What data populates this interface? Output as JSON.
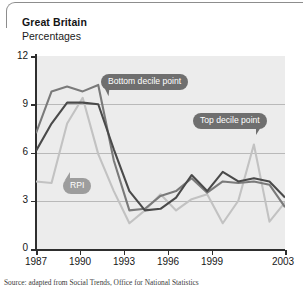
{
  "header": {
    "region": "Great Britain",
    "units": "Percentages"
  },
  "source_note": "Source: adapted from Social Trends, Office for National Statistics",
  "callouts": {
    "bottom": "Bottom decile point",
    "top": "Top decile point",
    "rpi": "RPI"
  },
  "colors": {
    "top_decile": "#4a4a4a",
    "bottom_decile": "#7a7a7a",
    "rpi": "#c2c2c2",
    "plot_background": "#ececec",
    "gridline": "#b9b9b9",
    "axis": "#2e2e2e",
    "callout_dark": "#6f6f6f",
    "callout_light": "#9d9d9d"
  },
  "chart_data": {
    "type": "line",
    "title": "Great Britain",
    "subtitle": "Percentages",
    "xlabel": "",
    "ylabel": "Percentages",
    "xlim": [
      1987,
      2003
    ],
    "ylim": [
      0,
      12
    ],
    "yticks": [
      0,
      3,
      6,
      9,
      12
    ],
    "xticks": [
      1987,
      1990,
      1993,
      1996,
      1999,
      2003
    ],
    "xtick_labels": [
      "1987",
      "1990",
      "1993",
      "1996",
      "1999",
      "2003"
    ],
    "ytick_labels": [
      "0",
      "3",
      "6",
      "9",
      "12"
    ],
    "grid": true,
    "legend": "inline-callouts",
    "x": [
      1987,
      1988,
      1989,
      1990,
      1991,
      1992,
      1993,
      1994,
      1995,
      1996,
      1997,
      1998,
      1999,
      2000,
      2001,
      2002,
      2003
    ],
    "series": [
      {
        "name": "Bottom decile point",
        "color": "#7a7a7a",
        "values": [
          7.2,
          9.8,
          10.1,
          9.8,
          10.2,
          5.5,
          2.4,
          2.5,
          3.3,
          3.6,
          4.4,
          3.5,
          4.2,
          4.1,
          4.2,
          4.0,
          2.6
        ]
      },
      {
        "name": "Top decile point",
        "color": "#4a4a4a",
        "values": [
          6.1,
          7.8,
          9.1,
          9.1,
          9.0,
          6.2,
          3.6,
          2.4,
          2.5,
          3.2,
          4.6,
          3.6,
          4.8,
          4.2,
          4.4,
          4.2,
          3.2
        ]
      },
      {
        "name": "RPI",
        "color": "#c2c2c2",
        "values": [
          4.2,
          4.1,
          7.8,
          9.4,
          5.9,
          3.6,
          1.6,
          2.4,
          3.4,
          2.4,
          3.1,
          3.4,
          1.6,
          3.0,
          6.5,
          1.7,
          2.9
        ]
      }
    ],
    "annotations": [
      {
        "label": "Bottom decile point",
        "points_to_series": "Bottom decile point",
        "near_x": 1991
      },
      {
        "label": "Top decile point",
        "points_to_series": "Top decile point",
        "near_x": 1999
      },
      {
        "label": "RPI",
        "points_to_series": "RPI",
        "near_x": 1990
      }
    ]
  }
}
